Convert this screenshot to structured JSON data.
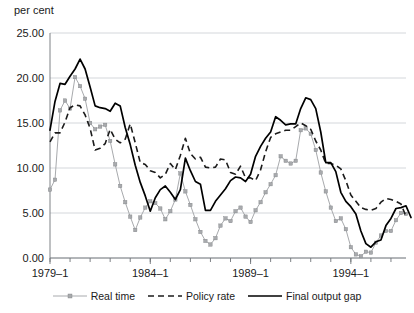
{
  "chart_data": {
    "type": "line",
    "title": "",
    "subtitle": "",
    "xlabel": "",
    "ylabel": "per cent",
    "ylim": [
      0,
      25
    ],
    "ytick_labels": [
      "0.00",
      "5.00",
      "10.00",
      "15.00",
      "20.00",
      "25.00"
    ],
    "ytick_values": [
      0,
      5,
      10,
      15,
      20,
      25
    ],
    "xtick_labels": [
      "1979–1",
      "1984–1",
      "1989–1",
      "1994–1"
    ],
    "xtick_indices": [
      0,
      20,
      40,
      60
    ],
    "grid": "horizontal",
    "legend_position": "bottom",
    "x_count": 72,
    "series": [
      {
        "name": "Real time",
        "color": "#a8aaad",
        "style": "solid-with-markers",
        "values": [
          7.6,
          8.7,
          16.4,
          17.5,
          16.6,
          20.1,
          19.1,
          17.7,
          15.0,
          14.3,
          14.6,
          14.8,
          13.0,
          10.4,
          8.0,
          6.2,
          4.6,
          3.1,
          4.5,
          5.6,
          6.3,
          6.1,
          5.5,
          4.3,
          5.2,
          6.5,
          9.4,
          7.4,
          5.9,
          4.3,
          2.9,
          1.9,
          1.5,
          2.2,
          3.6,
          4.4,
          4.1,
          5.2,
          5.6,
          4.6,
          4.0,
          5.3,
          6.2,
          7.3,
          8.2,
          9.2,
          11.3,
          10.8,
          10.5,
          10.8,
          14.2,
          14.4,
          13.8,
          12.0,
          9.5,
          7.4,
          5.6,
          4.1,
          4.4,
          3.2,
          1.2,
          0.4,
          0.2,
          0.7,
          0.6,
          1.7,
          2.5,
          3.0,
          3.0,
          4.2,
          5.0,
          4.9
        ]
      },
      {
        "name": "Policy rate",
        "color": "#1b1b1b",
        "style": "dashed",
        "values": [
          12.9,
          13.9,
          13.9,
          15.1,
          16.7,
          17.0,
          16.9,
          15.9,
          14.4,
          12.0,
          12.2,
          12.7,
          14.3,
          13.2,
          12.8,
          13.2,
          14.9,
          12.8,
          10.6,
          10.4,
          9.7,
          9.5,
          8.9,
          9.3,
          10.5,
          9.8,
          11.4,
          13.3,
          11.6,
          11.0,
          11.2,
          10.1,
          10.0,
          10.1,
          11.0,
          10.9,
          9.5,
          9.3,
          10.2,
          8.9,
          8.9,
          8.6,
          9.8,
          11.8,
          13.4,
          13.8,
          14.0,
          14.2,
          14.2,
          14.6,
          15.0,
          14.7,
          14.3,
          13.0,
          12.0,
          10.5,
          10.5,
          10.3,
          9.9,
          8.6,
          7.0,
          6.3,
          5.6,
          5.4,
          5.3,
          5.5,
          6.2,
          6.6,
          6.5,
          6.3,
          6.0,
          4.6
        ]
      },
      {
        "name": "Final output gap",
        "color": "#000000",
        "style": "solid",
        "values": [
          14.2,
          17.4,
          19.4,
          19.3,
          20.2,
          21.0,
          22.1,
          21.0,
          19.0,
          16.9,
          16.7,
          16.6,
          16.3,
          17.2,
          16.9,
          14.5,
          12.6,
          10.3,
          8.4,
          6.9,
          5.2,
          6.7,
          7.6,
          8.0,
          7.3,
          6.5,
          7.6,
          11.1,
          9.7,
          8.5,
          8.2,
          5.3,
          5.3,
          6.3,
          7.0,
          7.7,
          8.6,
          9.0,
          8.9,
          8.5,
          9.3,
          11.3,
          12.4,
          13.3,
          14.0,
          15.7,
          15.3,
          14.8,
          14.9,
          14.9,
          16.6,
          17.8,
          17.6,
          16.6,
          14.0,
          10.6,
          10.6,
          9.6,
          7.3,
          6.3,
          5.7,
          4.9,
          3.0,
          1.6,
          1.2,
          1.8,
          2.0,
          3.6,
          4.4,
          5.5,
          5.6,
          5.8,
          4.5
        ]
      }
    ]
  },
  "axis": {
    "unit_label": "per cent"
  },
  "legend": {
    "items": [
      {
        "label": "Real time",
        "marker": "line-with-dot-marker",
        "color": "#a8aaad"
      },
      {
        "label": "Policy rate",
        "marker": "dashed-line",
        "color": "#1b1b1b"
      },
      {
        "label": "Final output gap",
        "marker": "solid-line",
        "color": "#000000"
      }
    ]
  }
}
